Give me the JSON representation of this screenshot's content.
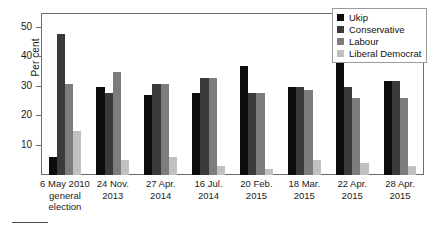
{
  "chart_data": {
    "type": "bar",
    "title": "",
    "xlabel": "",
    "ylabel": "Per cent",
    "ylim": [
      0,
      55
    ],
    "yticks": [
      10,
      20,
      30,
      40,
      50
    ],
    "grid": false,
    "legend_position": "top-right",
    "categories": [
      "6 May 2010 general election",
      "24 Nov. 2013",
      "27 Apr. 2014",
      "16 Jul. 2014",
      "20 Feb. 2015",
      "18 Mar. 2015",
      "22 Apr. 2015",
      "28 Apr. 2015"
    ],
    "category_lines": [
      {
        "line1": "6 May 2010",
        "line2": "general election"
      },
      {
        "line1": "24 Nov.",
        "line2": "2013"
      },
      {
        "line1": "27 Apr.",
        "line2": "2014"
      },
      {
        "line1": "16 Jul.",
        "line2": "2014"
      },
      {
        "line1": "20 Feb.",
        "line2": "2015"
      },
      {
        "line1": "18 Mar.",
        "line2": "2015"
      },
      {
        "line1": "22 Apr.",
        "line2": "2015"
      },
      {
        "line1": "28 Apr.",
        "line2": "2015"
      }
    ],
    "series": [
      {
        "name": "Ukip",
        "color": "#0d0d0d",
        "values": [
          6,
          30,
          27,
          28,
          37,
          30,
          39,
          32
        ]
      },
      {
        "name": "Conservative",
        "color": "#3a3a3a",
        "values": [
          48,
          28,
          31,
          33,
          28,
          30,
          30,
          32
        ]
      },
      {
        "name": "Labour",
        "color": "#7c7c7c",
        "values": [
          31,
          35,
          31,
          33,
          28,
          29,
          26,
          26
        ]
      },
      {
        "name": "Liberal Democrat",
        "color": "#c0c0c0",
        "values": [
          15,
          5,
          6,
          3,
          2,
          5,
          4,
          3
        ]
      }
    ]
  },
  "legend": {
    "items": [
      {
        "label": "Ukip"
      },
      {
        "label": "Conservative"
      },
      {
        "label": "Labour"
      },
      {
        "label": "Liberal Democrat"
      }
    ]
  },
  "axes": {
    "y_title": "Per cent"
  }
}
